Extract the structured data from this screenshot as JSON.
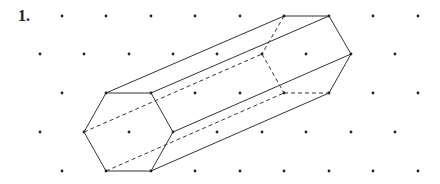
{
  "problem": {
    "label": "1."
  },
  "grid": {
    "rows_y": [
      16,
      54,
      93,
      132,
      171
    ],
    "even_row_x": [
      62,
      106,
      151,
      195,
      240,
      284,
      329,
      373,
      418
    ],
    "odd_row_x": [
      40,
      84,
      129,
      173,
      217,
      262,
      306,
      351,
      395
    ],
    "dot_color": "#222222"
  },
  "prism": {
    "front_hexagon": [
      [
        106,
        93
      ],
      [
        151,
        93
      ],
      [
        173,
        132
      ],
      [
        151,
        171
      ],
      [
        106,
        171
      ],
      [
        84,
        132
      ]
    ],
    "back_hexagon": [
      [
        284,
        16
      ],
      [
        329,
        16
      ],
      [
        351,
        54
      ],
      [
        329,
        93
      ],
      [
        284,
        93
      ],
      [
        262,
        54
      ]
    ],
    "solid_edges": [
      [
        [
          106,
          93
        ],
        [
          151,
          93
        ]
      ],
      [
        [
          151,
          93
        ],
        [
          173,
          132
        ]
      ],
      [
        [
          173,
          132
        ],
        [
          151,
          171
        ]
      ],
      [
        [
          151,
          171
        ],
        [
          106,
          171
        ]
      ],
      [
        [
          106,
          171
        ],
        [
          84,
          132
        ]
      ],
      [
        [
          84,
          132
        ],
        [
          106,
          93
        ]
      ],
      [
        [
          284,
          16
        ],
        [
          329,
          16
        ]
      ],
      [
        [
          329,
          16
        ],
        [
          351,
          54
        ]
      ],
      [
        [
          351,
          54
        ],
        [
          329,
          93
        ]
      ],
      [
        [
          106,
          93
        ],
        [
          284,
          16
        ]
      ],
      [
        [
          151,
          93
        ],
        [
          329,
          16
        ]
      ],
      [
        [
          173,
          132
        ],
        [
          351,
          54
        ]
      ],
      [
        [
          151,
          171
        ],
        [
          329,
          93
        ]
      ]
    ],
    "dashed_edges": [
      [
        [
          284,
          16
        ],
        [
          262,
          54
        ]
      ],
      [
        [
          262,
          54
        ],
        [
          284,
          93
        ]
      ],
      [
        [
          284,
          93
        ],
        [
          329,
          93
        ]
      ],
      [
        [
          106,
          171
        ],
        [
          284,
          93
        ]
      ],
      [
        [
          84,
          132
        ],
        [
          262,
          54
        ]
      ]
    ],
    "line_color": "#333333"
  }
}
